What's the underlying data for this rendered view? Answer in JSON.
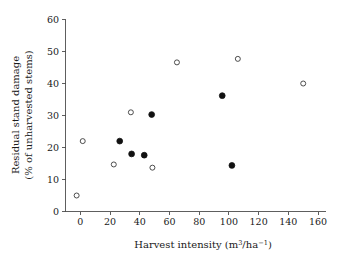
{
  "chart_data": {
    "type": "scatter",
    "title": "",
    "xlabel": "Harvest intensity (m3/ha-1)",
    "ylabel": "Residual stand damage (% of unharvested stems)",
    "ylabel_line1": "Residual stand damage",
    "ylabel_line2": "(% of unharvested stems)",
    "xlabel_prefix": "Harvest intensity (m",
    "xlabel_sup1": "3",
    "xlabel_mid": "/ha",
    "xlabel_sup2": "−1",
    "xlabel_suffix": ")",
    "xlim": [
      -10,
      165
    ],
    "ylim": [
      0,
      60
    ],
    "xticks": [
      0,
      20,
      40,
      60,
      80,
      100,
      120,
      140,
      160
    ],
    "xticklabels": [
      "0",
      "20",
      "40",
      "60",
      "80",
      "100",
      "120",
      "140",
      "160"
    ],
    "yticks": [
      0,
      10,
      20,
      30,
      40,
      50,
      60
    ],
    "yticklabels": [
      "0",
      "10",
      "20",
      "30",
      "40",
      "50",
      "60"
    ],
    "grid": false,
    "legend": "none",
    "marker_colors": {
      "open": "#3a3a3a",
      "filled": "#111111"
    },
    "series": [
      {
        "name": "open",
        "marker": "open-circle",
        "points": [
          {
            "x": -2.5,
            "y": 5.0
          },
          {
            "x": 1.6,
            "y": 22.0
          },
          {
            "x": 22.5,
            "y": 14.7
          },
          {
            "x": 34.0,
            "y": 31.0
          },
          {
            "x": 48.5,
            "y": 13.7
          },
          {
            "x": 65.0,
            "y": 46.6
          },
          {
            "x": 106.0,
            "y": 47.7
          },
          {
            "x": 150.0,
            "y": 40.0
          }
        ]
      },
      {
        "name": "filled",
        "marker": "filled-circle",
        "points": [
          {
            "x": 26.5,
            "y": 22.0
          },
          {
            "x": 34.5,
            "y": 18.0
          },
          {
            "x": 43.0,
            "y": 17.6
          },
          {
            "x": 48.0,
            "y": 30.3
          },
          {
            "x": 95.5,
            "y": 36.2
          },
          {
            "x": 102.0,
            "y": 14.4
          }
        ]
      }
    ]
  }
}
